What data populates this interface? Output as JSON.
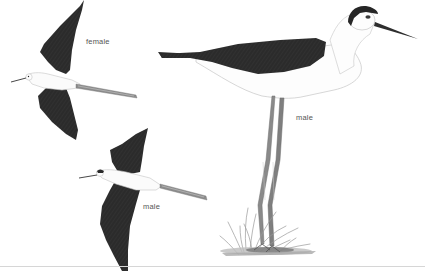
{
  "illustration": {
    "subject": "black-winged stilt",
    "figures": [
      {
        "id": "flying-female",
        "label": "female",
        "pose": "flying"
      },
      {
        "id": "flying-male",
        "label": "male",
        "pose": "flying"
      },
      {
        "id": "standing-male",
        "label": "male",
        "pose": "standing"
      }
    ]
  },
  "colors": {
    "background": "#ffffff",
    "wing_dark": "#2a2a2a",
    "body_white": "#fafafa",
    "outline": "#bdbdbd",
    "legs": "#7a7a7a",
    "grass": "#9a9a9a",
    "label": "#555555",
    "baseline": "#d6d6d6"
  }
}
